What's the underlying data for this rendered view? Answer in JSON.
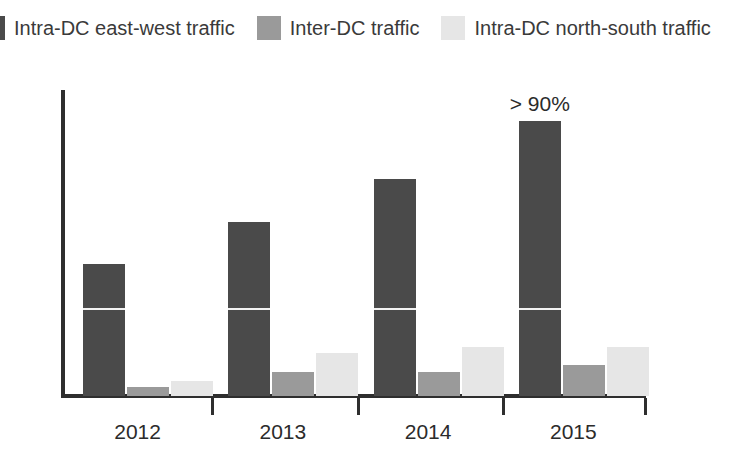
{
  "legend": {
    "items": [
      {
        "label": "Intra-DC east-west traffic",
        "color": "#4a4a4a",
        "icon": "legend-swatch-icon"
      },
      {
        "label": "Inter-DC traffic",
        "color": "#9a9a9a",
        "icon": "legend-swatch-icon"
      },
      {
        "label": "Intra-DC north-south traffic",
        "color": "#e6e6e6",
        "icon": "legend-swatch-icon"
      }
    ]
  },
  "chart_data": {
    "type": "bar",
    "title": "",
    "subtitle": "",
    "xlabel": "",
    "ylabel": "",
    "grid": false,
    "legend_position": "top",
    "categories": [
      "2012",
      "2013",
      "2014",
      "2015"
    ],
    "ylim": [
      0,
      100
    ],
    "yticks": [],
    "series": [
      {
        "name": "Intra-DC east-west traffic",
        "color": "#4a4a4a",
        "values": [
          43,
          57,
          71,
          90
        ]
      },
      {
        "name": "Inter-DC traffic",
        "color": "#9a9a9a",
        "values": [
          3,
          8,
          8,
          10
        ]
      },
      {
        "name": "Intra-DC north-south traffic",
        "color": "#e6e6e6",
        "values": [
          5,
          14,
          16,
          16
        ]
      }
    ],
    "annotations": [
      {
        "text": "> 90%",
        "category": "2015",
        "series": "Intra-DC east-west traffic"
      }
    ]
  },
  "axis": {
    "tick_labels": [
      "2012",
      "2013",
      "2014",
      "2015"
    ]
  }
}
